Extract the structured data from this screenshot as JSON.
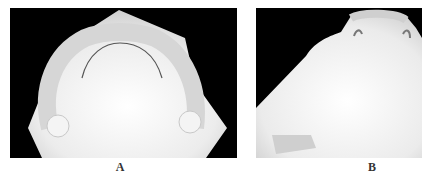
{
  "figure": {
    "panels": [
      {
        "id": "A",
        "label": "A",
        "content": "occlusal view of maxillary dental cast (full arch)"
      },
      {
        "id": "B",
        "label": "B",
        "content": "dental cast with anterior teeth and wire clasps, trimmed base"
      }
    ],
    "colors": {
      "background": "#000000",
      "cast": "#e8e8e8",
      "page": "#ffffff"
    }
  }
}
